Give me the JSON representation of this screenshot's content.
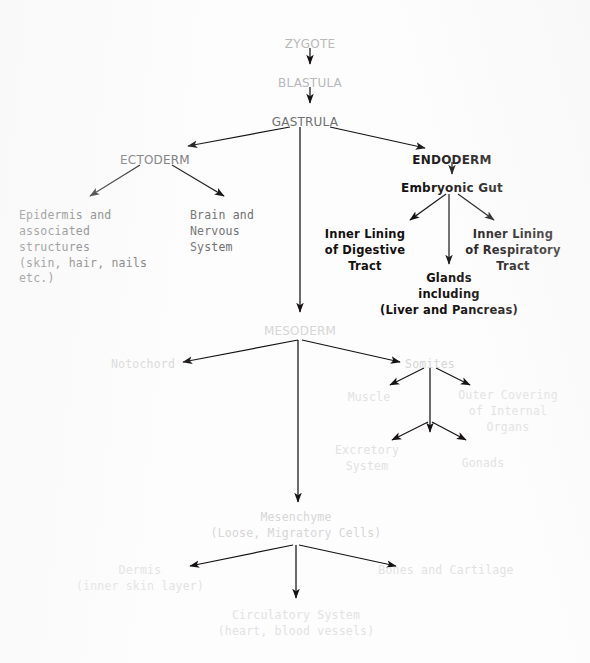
{
  "diagram": {
    "type": "flowchart",
    "background_color": "#fdfdfd",
    "edge_color": "#161212",
    "nodes": [
      {
        "id": "zygote",
        "label": "ZYGOTE",
        "x": 310,
        "y": 36,
        "tone": "t-pale",
        "size": "fs-lg",
        "font": "sans"
      },
      {
        "id": "blastula",
        "label": "BLASTULA",
        "x": 310,
        "y": 75,
        "tone": "t-pale",
        "size": "fs-lg",
        "font": "sans"
      },
      {
        "id": "gastrula",
        "label": "GASTRULA",
        "x": 305,
        "y": 114,
        "tone": "t-mid",
        "size": "fs-lg",
        "font": "sans"
      },
      {
        "id": "ectoderm",
        "label": "ECTODERM",
        "x": 155,
        "y": 152,
        "tone": "t-mid",
        "size": "fs-lg",
        "font": "sans"
      },
      {
        "id": "endoderm",
        "label": "ENDODERM",
        "x": 452,
        "y": 152,
        "tone": "t-dark",
        "size": "fs-lg",
        "font": "sans"
      },
      {
        "id": "embryonic-gut",
        "label": "Embryonic Gut",
        "x": 452,
        "y": 180,
        "tone": "t-dark",
        "size": "fs-lg",
        "font": "sans"
      },
      {
        "id": "epidermis",
        "label": "Epidermis and\nassociated\nstructures\n(skin, hair, nails\netc.)",
        "x": 83,
        "y": 208,
        "tone": "t-mid",
        "size": "fs-md",
        "font": "mono",
        "align": "left"
      },
      {
        "id": "brain",
        "label": "Brain and\nNervous\nSystem",
        "x": 222,
        "y": 208,
        "tone": "t-mid",
        "size": "fs-md",
        "font": "mono",
        "align": "left"
      },
      {
        "id": "digestive",
        "label": "Inner Lining\nof Digestive\nTract",
        "x": 365,
        "y": 227,
        "tone": "t-dark",
        "size": "fs-md",
        "font": "sans"
      },
      {
        "id": "respiratory",
        "label": "Inner Lining\nof Respiratory\nTract",
        "x": 513,
        "y": 227,
        "tone": "t-dark",
        "size": "fs-md",
        "font": "sans"
      },
      {
        "id": "glands",
        "label": "Glands\nincluding\n(Liver and Pancreas)",
        "x": 449,
        "y": 271,
        "tone": "t-dark",
        "size": "fs-md",
        "font": "sans"
      },
      {
        "id": "mesoderm",
        "label": "MESODERM",
        "x": 300,
        "y": 323,
        "tone": "t-faint",
        "size": "fs-lg",
        "font": "sans"
      },
      {
        "id": "notochord",
        "label": "Notochord",
        "x": 143,
        "y": 357,
        "tone": "t-faint",
        "size": "fs-md",
        "font": "mono"
      },
      {
        "id": "somites",
        "label": "Somites",
        "x": 430,
        "y": 357,
        "tone": "t-faint",
        "size": "fs-md",
        "font": "mono"
      },
      {
        "id": "muscle",
        "label": "Muscle",
        "x": 369,
        "y": 390,
        "tone": "t-ghost",
        "size": "fs-md",
        "font": "mono"
      },
      {
        "id": "outer-cover",
        "label": "Outer Covering\nof Internal\nOrgans",
        "x": 508,
        "y": 388,
        "tone": "t-ghost",
        "size": "fs-md",
        "font": "mono"
      },
      {
        "id": "excretory",
        "label": "Excretory\nSystem",
        "x": 367,
        "y": 443,
        "tone": "t-ghost",
        "size": "fs-md",
        "font": "mono"
      },
      {
        "id": "gonads",
        "label": "Gonads",
        "x": 483,
        "y": 456,
        "tone": "t-ghost",
        "size": "fs-md",
        "font": "mono"
      },
      {
        "id": "mesenchyme",
        "label": "Mesenchyme\n(Loose, Migratory Cells)",
        "x": 296,
        "y": 510,
        "tone": "t-faint",
        "size": "fs-md",
        "font": "mono"
      },
      {
        "id": "dermis",
        "label": "Dermis\n(inner skin layer)",
        "x": 140,
        "y": 563,
        "tone": "t-ghost",
        "size": "fs-md",
        "font": "mono"
      },
      {
        "id": "bones",
        "label": "Bones and Cartilage",
        "x": 446,
        "y": 563,
        "tone": "t-ghost",
        "size": "fs-md",
        "font": "mono"
      },
      {
        "id": "circulatory",
        "label": "Circulatory System\n(heart, blood vessels)",
        "x": 296,
        "y": 608,
        "tone": "t-ghost",
        "size": "fs-md",
        "font": "mono"
      }
    ],
    "edges": [
      {
        "from": "zygote",
        "to": "blastula",
        "path": "M310,48 L310,64",
        "shade": "dark",
        "head": true
      },
      {
        "from": "blastula",
        "to": "gastrula",
        "path": "M310,87 L310,103",
        "shade": "dark",
        "head": true
      },
      {
        "from": "gastrula",
        "to": "ectoderm",
        "path": "M290,127 L188,146",
        "shade": "dark",
        "head": true
      },
      {
        "from": "gastrula",
        "to": "endoderm",
        "path": "M330,127 L425,148",
        "shade": "dark",
        "head": true
      },
      {
        "from": "gastrula",
        "to": "mesoderm",
        "path": "M300,127 L300,312",
        "shade": "dark",
        "head": true
      },
      {
        "from": "ectoderm",
        "to": "epidermis",
        "path": "M140,165 L90,196",
        "shade": "dark",
        "head": true
      },
      {
        "from": "ectoderm",
        "to": "brain",
        "path": "M172,165 L224,196",
        "shade": "dark",
        "head": true
      },
      {
        "from": "endoderm",
        "to": "embryonic-gut",
        "path": "M452,162 L452,174",
        "shade": "dark",
        "head": true
      },
      {
        "from": "embryonic-gut",
        "to": "digestive",
        "path": "M446,194 L410,220",
        "shade": "dark",
        "head": true
      },
      {
        "from": "embryonic-gut",
        "to": "respiratory",
        "path": "M458,194 L494,220",
        "shade": "dark",
        "head": true
      },
      {
        "from": "embryonic-gut",
        "to": "glands",
        "path": "M449,194 L449,264",
        "shade": "dark",
        "head": true
      },
      {
        "from": "mesoderm",
        "to": "notochord",
        "path": "M298,340 L183,362",
        "shade": "dark",
        "head": true
      },
      {
        "from": "mesoderm",
        "to": "somites",
        "path": "M302,340 L400,362",
        "shade": "dark",
        "head": true
      },
      {
        "from": "mesoderm",
        "to": "mesenchyme",
        "path": "M298,340 L298,502",
        "shade": "dark",
        "head": true
      },
      {
        "from": "somites",
        "to": "muscle",
        "path": "M424,368 L390,385",
        "shade": "dark",
        "head": true
      },
      {
        "from": "somites",
        "to": "outer-cover",
        "path": "M436,368 L470,385",
        "shade": "dark",
        "head": true
      },
      {
        "from": "somites",
        "to": "excretory",
        "path": "M430,368 L430,432",
        "shade": "dark",
        "head": true
      },
      {
        "from": "excretory-hub",
        "to": "excretory",
        "path": "M428,422 L392,440",
        "shade": "dark",
        "head": true
      },
      {
        "from": "excretory-hub",
        "to": "gonads",
        "path": "M432,422 L466,440",
        "shade": "dark",
        "head": true
      },
      {
        "from": "mesenchyme",
        "to": "dermis",
        "path": "M293,545 L190,566",
        "shade": "dark",
        "head": true
      },
      {
        "from": "mesenchyme",
        "to": "bones",
        "path": "M299,545 L396,566",
        "shade": "dark",
        "head": true
      },
      {
        "from": "mesenchyme",
        "to": "circulatory",
        "path": "M296,545 L296,598",
        "shade": "dark",
        "head": true
      }
    ]
  }
}
